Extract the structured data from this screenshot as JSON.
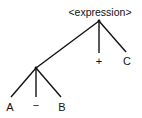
{
  "diagram": {
    "type": "parse-tree",
    "root": {
      "label": "<expression>",
      "children": [
        "subtree",
        "+",
        "C"
      ]
    },
    "subtree": {
      "children": [
        "A",
        "−",
        "B"
      ]
    },
    "labels": {
      "root": "<expression>",
      "plus": "+",
      "c": "C",
      "a": "A",
      "minus": "−",
      "b": "B"
    },
    "colors": {
      "ink": "#111111",
      "background": "#ffffff"
    }
  }
}
